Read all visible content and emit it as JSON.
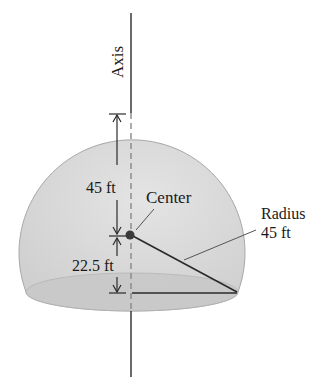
{
  "figure": {
    "type": "hemispherical dome (sphere cap) diagram",
    "labels": {
      "axis": "Axis",
      "height_above_center": "45 ft",
      "height_below_center": "22.5 ft",
      "center": "Center",
      "radius_title": "Radius",
      "radius_value": "45 ft"
    },
    "colors": {
      "dome_fill": "#d6d6d6",
      "dome_edge": "#a8a8a8",
      "base_fill": "#c4c4c4",
      "line": "#2a2a2a",
      "background": "#ffffff"
    }
  }
}
